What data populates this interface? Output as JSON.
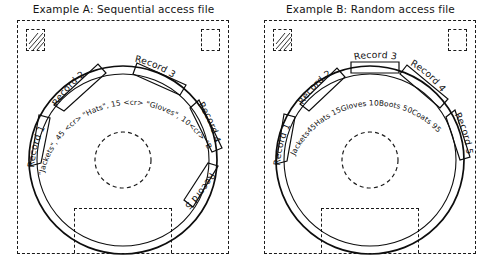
{
  "page": {
    "background_color": "#ffffff",
    "ink_color": "#0d0d0d"
  },
  "panels": [
    {
      "id": "example-a",
      "title": "Example A:  Sequential access file",
      "disc": {
        "hub_label": "",
        "track_content": "\"Jackets\", 45 <cr> \"Hats\", 15 <cr> \"Gloves\", 10<cr> \"Boots\", 50 <cr> \"Coats\", 96 <cr>"
      },
      "records": [
        {
          "label": "Record 1",
          "content": "\"Jackets\", 45 <cr>"
        },
        {
          "label": "Record 2",
          "content": "\"Hats\", 15 <cr>"
        },
        {
          "label": "Record 3",
          "content": "\"Gloves\", 10<cr>"
        },
        {
          "label": "Record 4",
          "content": "\"Boots\", 50 <cr>"
        },
        {
          "label": "Record 5",
          "content": "\"Coats\", 96 <cr>"
        }
      ]
    },
    {
      "id": "example-b",
      "title": "Example B:  Random access file",
      "disc": {
        "hub_label": "",
        "track_content": "Jackets45Hats 15Gloves 10Boots 50Coats 95"
      },
      "records": [
        {
          "label": "Record 1",
          "content": "Jackets45"
        },
        {
          "label": "Record 2",
          "content": "Hats"
        },
        {
          "label": "Record 3",
          "content": "15Gloves 10Boots"
        },
        {
          "label": "Record 4",
          "content": " 50Coats"
        },
        {
          "label": "Record 5",
          "content": " 95"
        }
      ]
    }
  ]
}
